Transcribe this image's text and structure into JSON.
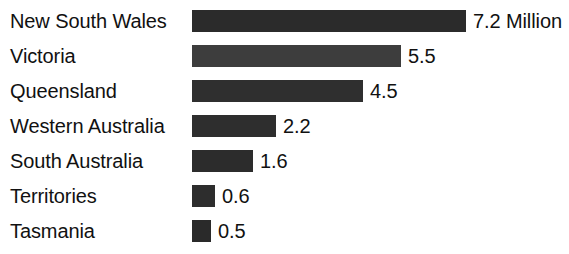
{
  "chart_data": {
    "type": "bar",
    "title": "",
    "subtitle": "",
    "xlabel": "",
    "ylabel": "",
    "orientation": "horizontal",
    "grid": false,
    "legend": "none",
    "unit_note": "Million",
    "xlim": [
      0,
      7.2
    ],
    "categories": [
      "New South Wales",
      "Victoria",
      "Queensland",
      "Western Australia",
      "South Australia",
      "Territories",
      "Tasmania"
    ],
    "values": [
      7.2,
      5.5,
      4.5,
      2.2,
      1.6,
      0.6,
      0.5
    ],
    "value_labels": [
      "7.2 Million",
      "5.5",
      "4.5",
      "2.2",
      "1.6",
      "0.6",
      "0.5"
    ],
    "bar_colors": [
      "#2b2b2b",
      "#3d3d3d",
      "#2f2f2f",
      "#2e2e2e",
      "#2c2c2c",
      "#2d2d2d",
      "#2a2a2a"
    ]
  },
  "scale": {
    "bar_origin_px": 192,
    "px_per_unit": 38,
    "row_pitch_px": 35,
    "first_row_top_px": 3,
    "value_gap_px": 7
  }
}
